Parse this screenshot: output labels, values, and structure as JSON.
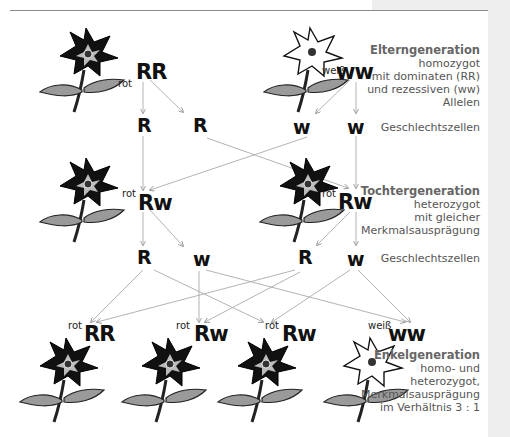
{
  "diagram": {
    "parents": {
      "left": {
        "color": "rot",
        "genotype": "RR",
        "flower": "red-flower"
      },
      "right": {
        "color": "weiß",
        "genotype": "ww",
        "flower": "white-flower"
      },
      "gametes": [
        "R",
        "R",
        "w",
        "w"
      ]
    },
    "f1": {
      "left": {
        "color": "rot",
        "genotype": "Rw",
        "flower": "red-flower"
      },
      "right": {
        "color": "rot",
        "genotype": "Rw",
        "flower": "red-flower"
      },
      "gametes": [
        "R",
        "w",
        "R",
        "w"
      ]
    },
    "f2": [
      {
        "color": "rot",
        "genotype": "RR",
        "flower": "red-flower"
      },
      {
        "color": "rot",
        "genotype": "Rw",
        "flower": "red-flower"
      },
      {
        "color": "rot",
        "genotype": "Rw",
        "flower": "red-flower"
      },
      {
        "color": "weiß",
        "genotype": "ww",
        "flower": "white-flower"
      }
    ],
    "descriptions": {
      "parents": {
        "title": "Elterngeneration",
        "lines": [
          "homozygot",
          "mit dominaten (RR)",
          "und rezessiven (ww)",
          "Allelen"
        ]
      },
      "gametes1": {
        "title": "",
        "lines": [
          "Geschlechtszellen"
        ]
      },
      "f1": {
        "title": "Tochtergeneration",
        "lines": [
          "heterozygot",
          "mit gleicher",
          "Merkmalsausprägung"
        ]
      },
      "gametes2": {
        "title": "",
        "lines": [
          "Geschlechtszellen"
        ]
      },
      "f2": {
        "title": "Enkelgeneration",
        "lines": [
          "homo- und",
          "heterozygot,",
          "Merkmalsausprägung",
          "im Verhältnis 3 : 1"
        ]
      }
    },
    "colors": {
      "red_flower_fill": "#111111",
      "red_flower_inner": "#bbbbbb",
      "white_flower_fill": "#ffffff",
      "leaf_fill": "#9a9a9a",
      "arrow": "#aaaaaa",
      "panel": "#eeeeee"
    }
  }
}
